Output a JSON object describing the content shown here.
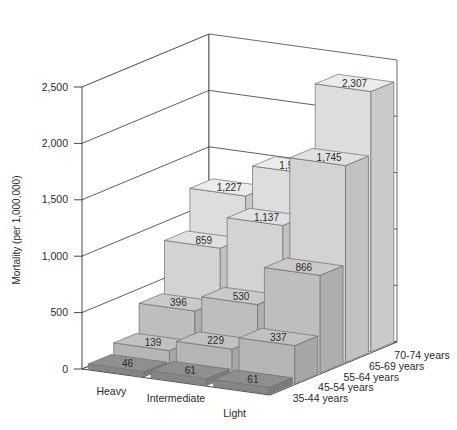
{
  "chart_data": {
    "type": "bar",
    "subtype": "3d-grouped-bar",
    "title": "",
    "xlabel": "",
    "ylabel": "Mortality (per 1,000,000)",
    "categories": [
      "Heavy",
      "Intermediate",
      "Light"
    ],
    "depth_categories": [
      "35-44 years",
      "45-54 years",
      "55-64 years",
      "65-69 years",
      "70-74 years"
    ],
    "series": [
      {
        "name": "35-44 years",
        "values": [
          46,
          61,
          61
        ],
        "color": "#8c8c8c"
      },
      {
        "name": "45-54 years",
        "values": [
          139,
          229,
          337
        ],
        "color": "#bdbdbd"
      },
      {
        "name": "55-64 years",
        "values": [
          396,
          530,
          866
        ],
        "color": "#c6c6c6"
      },
      {
        "name": "65-69 years",
        "values": [
          859,
          1137,
          1745
        ],
        "color": "#dcdcdc"
      },
      {
        "name": "70-74 years",
        "values": [
          1227,
          1501,
          2307
        ],
        "color": "#e6e6e6"
      }
    ],
    "value_labels": [
      [
        "46",
        "61",
        "61"
      ],
      [
        "139",
        "229",
        "337"
      ],
      [
        "396",
        "530",
        "866"
      ],
      [
        "859",
        "1,137",
        "1,745"
      ],
      [
        "1,227",
        "1,501",
        "2,307"
      ]
    ],
    "yticks": [
      0,
      500,
      1000,
      1500,
      2000,
      2500
    ],
    "ytick_labels": [
      "0",
      "500",
      "1,000",
      "1,500",
      "2,000",
      "2,500"
    ],
    "ylim": [
      0,
      2500
    ],
    "grid": true,
    "legend_position": "depth-axis"
  }
}
